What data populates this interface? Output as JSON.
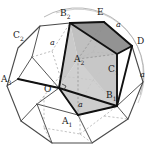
{
  "figure": {
    "colors": {
      "background": "#ffffff",
      "solid_edge": "#3b3b3b",
      "hidden_edge": "#9a9a9a",
      "cube_edge": "#111111",
      "face_top": "#8f8f8f",
      "face_front": "#c9c9c9",
      "face_left": "#b5b5b5",
      "circle_arc": "#8a8a8a",
      "label_text": "#1a1a1a"
    }
  },
  "vertex_labels": [
    {
      "id": "B2",
      "base": "B",
      "sub": "2",
      "x": 60,
      "y": 9
    },
    {
      "id": "E",
      "base": "E",
      "sub": "",
      "x": 97,
      "y": 8
    },
    {
      "id": "D",
      "base": "D",
      "sub": "",
      "x": 137,
      "y": 37
    },
    {
      "id": "C2",
      "base": "C",
      "sub": "2",
      "x": 13,
      "y": 31
    },
    {
      "id": "A2",
      "base": "A",
      "sub": "2",
      "x": 74,
      "y": 55
    },
    {
      "id": "C1",
      "base": "C",
      "sub": "1",
      "x": 108,
      "y": 65
    },
    {
      "id": "A3",
      "base": "A",
      "sub": "3",
      "x": 1,
      "y": 75
    },
    {
      "id": "O",
      "base": "O",
      "sub": "",
      "x": 44,
      "y": 85
    },
    {
      "id": "B1",
      "base": "B",
      "sub": "1",
      "x": 106,
      "y": 91
    },
    {
      "id": "A1",
      "base": "A",
      "sub": "1",
      "x": 62,
      "y": 117
    }
  ],
  "edge_labels": [
    {
      "id": "a-top",
      "text": "a",
      "x": 116,
      "y": 21
    },
    {
      "id": "a-left",
      "text": "a",
      "x": 50,
      "y": 39
    },
    {
      "id": "a-right",
      "text": "a",
      "x": 140,
      "y": 71
    },
    {
      "id": "a-bottom",
      "text": "a",
      "x": 78,
      "y": 101
    }
  ],
  "geometry": {
    "cube_vertices": {
      "O": [
        59,
        88
      ],
      "A1": [
        78,
        115
      ],
      "A2": [
        78,
        59
      ],
      "A3": [
        18,
        79
      ],
      "B1": [
        117,
        106
      ],
      "B2": [
        70,
        23
      ],
      "C1": [
        117,
        54
      ],
      "D": [
        132,
        46
      ],
      "E": [
        104,
        22
      ]
    },
    "circle": {
      "cx": 78,
      "cy": 78,
      "r": 66
    }
  }
}
